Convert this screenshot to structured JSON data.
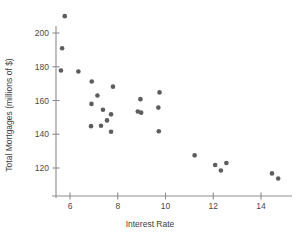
{
  "chart_data": {
    "type": "scatter",
    "title": "",
    "xlabel": "Interest Rate",
    "ylabel": "Total Mortgages (millions of $)",
    "xlim": [
      5.2,
      15.1
    ],
    "ylim": [
      112,
      213
    ],
    "grid": false,
    "legend": null,
    "xticks": [
      6,
      8,
      10,
      12,
      14
    ],
    "xtick_labels": [
      "6",
      "8",
      "10",
      "12",
      "14"
    ],
    "yticks": [
      120,
      140,
      160,
      180,
      200
    ],
    "ytick_labels": [
      "120",
      "140",
      "160",
      "180",
      "200"
    ],
    "point_color": "#5d5d5d",
    "point_radius": 2.3,
    "axis_color": "#8d8d8d",
    "points": [
      {
        "x": 5.78,
        "y": 210.0
      },
      {
        "x": 5.67,
        "y": 191.0
      },
      {
        "x": 5.62,
        "y": 177.8
      },
      {
        "x": 6.35,
        "y": 177.2
      },
      {
        "x": 6.91,
        "y": 171.3
      },
      {
        "x": 7.15,
        "y": 163.0
      },
      {
        "x": 6.9,
        "y": 158.0
      },
      {
        "x": 7.8,
        "y": 168.2
      },
      {
        "x": 7.38,
        "y": 154.5
      },
      {
        "x": 7.72,
        "y": 151.8
      },
      {
        "x": 7.55,
        "y": 148.2
      },
      {
        "x": 6.88,
        "y": 144.8
      },
      {
        "x": 7.3,
        "y": 145.0
      },
      {
        "x": 7.72,
        "y": 141.5
      },
      {
        "x": 8.95,
        "y": 160.8
      },
      {
        "x": 9.75,
        "y": 164.8
      },
      {
        "x": 9.7,
        "y": 155.8
      },
      {
        "x": 8.84,
        "y": 153.5
      },
      {
        "x": 8.98,
        "y": 152.8
      },
      {
        "x": 9.72,
        "y": 141.8
      },
      {
        "x": 11.22,
        "y": 127.5
      },
      {
        "x": 12.08,
        "y": 121.8
      },
      {
        "x": 12.55,
        "y": 123.0
      },
      {
        "x": 12.32,
        "y": 118.5
      },
      {
        "x": 14.46,
        "y": 116.8
      },
      {
        "x": 14.72,
        "y": 113.8
      }
    ]
  }
}
